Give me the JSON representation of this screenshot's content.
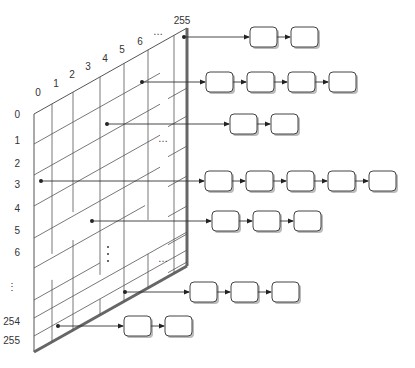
{
  "diagram": {
    "title": "",
    "row_labels": [
      "0",
      "1",
      "2",
      "3",
      "4",
      "5",
      "6",
      "⋮",
      "254",
      "255"
    ],
    "column_labels": [
      "0",
      "1",
      "2",
      "3",
      "4",
      "5",
      "6",
      "…",
      "255"
    ],
    "interior_ellipses": [
      "…",
      "⋮",
      "…",
      "…"
    ],
    "chains": [
      {
        "id": "chain-col255-row0",
        "node_count": 2
      },
      {
        "id": "chain-col6-row1",
        "node_count": 4
      },
      {
        "id": "chain-col4-row2",
        "node_count": 2
      },
      {
        "id": "chain-col0-row3",
        "node_count": 5
      },
      {
        "id": "chain-col3-row5",
        "node_count": 3
      },
      {
        "id": "chain-col5-row254",
        "node_count": 3
      },
      {
        "id": "chain-col1-row255",
        "node_count": 2
      }
    ]
  }
}
